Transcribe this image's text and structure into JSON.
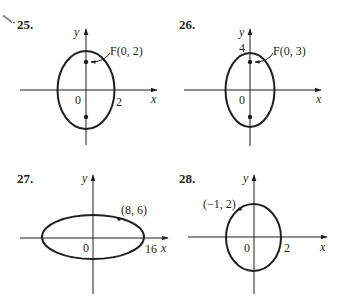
{
  "page": {
    "background": "#ffffff",
    "ink_color": "#231f20"
  },
  "exercises": [
    {
      "number": "25.",
      "marker_icon": "pencil-icon",
      "x_axis_label": "x",
      "y_axis_label": "y",
      "origin_label": "0",
      "x_tick_label": "2",
      "focus_label": "F(0, 2)",
      "shape": "vertical-ellipse"
    },
    {
      "number": "26.",
      "x_axis_label": "x",
      "y_axis_label": "y",
      "origin_label": "0",
      "y_tick_label": "4",
      "focus_label": "F(0, 3)",
      "shape": "vertical-ellipse"
    },
    {
      "number": "27.",
      "x_axis_label": "x",
      "y_axis_label": "y",
      "origin_label": "0",
      "x_tick_label": "16",
      "point_label": "(8, 6)",
      "shape": "horizontal-ellipse"
    },
    {
      "number": "28.",
      "x_axis_label": "x",
      "y_axis_label": "y",
      "origin_label": "0",
      "x_tick_label": "2",
      "point_label": "(−1, 2)",
      "shape": "ellipse"
    }
  ]
}
